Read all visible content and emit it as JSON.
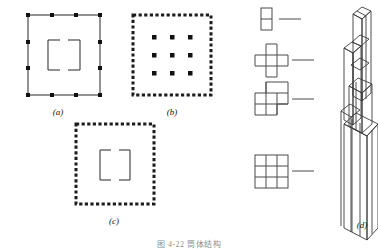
{
  "figure": {
    "caption": "图 4-22 筒体结构",
    "panels": [
      {
        "id": "a",
        "label": "(a)",
        "name": "framed-tube-with-core",
        "outer_border": "solid",
        "perimeter_marker_count": 12,
        "has_inner_core": true
      },
      {
        "id": "b",
        "label": "(b)",
        "name": "tube-with-interior-columns",
        "outer_border": "dotted",
        "interior_column_grid": {
          "rows": 3,
          "cols": 3,
          "count": 9
        },
        "has_inner_core": false
      },
      {
        "id": "c",
        "label": "(c)",
        "name": "tube-in-tube",
        "outer_border": "dotted",
        "has_inner_core": true
      },
      {
        "id": "d",
        "label": "(d)",
        "name": "bundled-tube-building",
        "cross_sections": [
          {
            "order": 1,
            "name": "two-cell-section",
            "cells": 2,
            "grid": "1x2",
            "level": "top"
          },
          {
            "order": 2,
            "name": "cross-plus-section",
            "cells": 5,
            "grid": "plus",
            "level": "upper"
          },
          {
            "order": 3,
            "name": "stepped-section",
            "cells": 7,
            "grid": "3x3-minus-2",
            "level": "middle"
          },
          {
            "order": 4,
            "name": "full-nine-cell-section",
            "cells": 9,
            "grid": "3x3",
            "level": "base"
          }
        ],
        "tube_count": 9
      }
    ]
  },
  "colors": {
    "line": "#262626",
    "marker": "#111111",
    "background": "#ffffff"
  }
}
